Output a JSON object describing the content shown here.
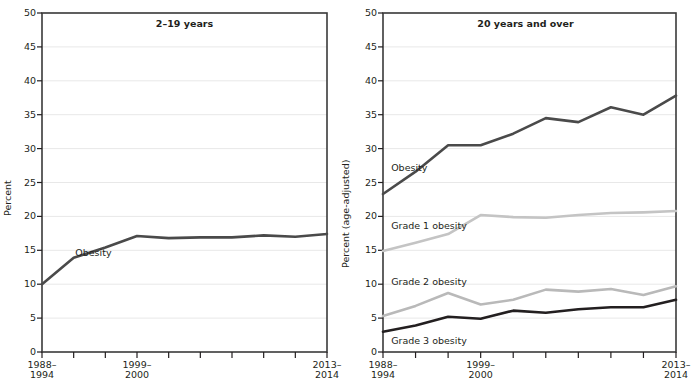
{
  "figure": {
    "background": "#ffffff",
    "grid_color": "#e8e8e8",
    "frame_color": "#3a3a3a"
  },
  "chart_data": [
    {
      "type": "line",
      "title": "2–19 years",
      "xlabel": "",
      "ylabel": "Percent",
      "ylim": [
        0,
        50
      ],
      "ytick_labels": [
        "0",
        "5",
        "10",
        "15",
        "20",
        "25",
        "30",
        "35",
        "40",
        "45",
        "50"
      ],
      "ytick_values": [
        0,
        5,
        10,
        15,
        20,
        25,
        30,
        35,
        40,
        45,
        50
      ],
      "grid": true,
      "legend": "inline-labels",
      "x": [
        1,
        2,
        3,
        4,
        5,
        6,
        7,
        8,
        9,
        10
      ],
      "xtick_labels": [
        "1988–\n1994",
        "",
        "",
        "1999–\n2000",
        "",
        "",
        "",
        "",
        "",
        "2013–\n2014"
      ],
      "xtick_label_lines": [
        [
          "1988–",
          "1994"
        ],
        [
          "1999–",
          "2000"
        ],
        [
          "2013–",
          "2014"
        ]
      ],
      "xtick_label_index": [
        0,
        3,
        9
      ],
      "series": [
        {
          "name": "Obesity",
          "color": "#4a4a4a",
          "width": 2.6,
          "label_x": 2.05,
          "label_y": 14.6,
          "values": [
            10.0,
            13.9,
            15.4,
            17.1,
            16.8,
            16.9,
            16.9,
            17.2,
            17.0,
            17.4
          ]
        }
      ]
    },
    {
      "type": "line",
      "title": "20 years and over",
      "xlabel": "",
      "ylabel": "Percent (age-adjusted)",
      "ylim": [
        0,
        50
      ],
      "ytick_labels": [
        "0",
        "5",
        "10",
        "15",
        "20",
        "25",
        "30",
        "35",
        "40",
        "45",
        "50"
      ],
      "ytick_values": [
        0,
        5,
        10,
        15,
        20,
        25,
        30,
        35,
        40,
        45,
        50
      ],
      "grid": true,
      "legend": "inline-labels",
      "x": [
        1,
        2,
        3,
        4,
        5,
        6,
        7,
        8,
        9,
        10
      ],
      "xtick_labels": [
        "1988–\n1994",
        "",
        "",
        "1999–\n2000",
        "",
        "",
        "",
        "",
        "",
        "2013–\n2014"
      ],
      "xtick_label_lines": [
        [
          "1988–",
          "1994"
        ],
        [
          "1999–",
          "2000"
        ],
        [
          "2013–",
          "2014"
        ]
      ],
      "xtick_label_index": [
        0,
        3,
        9
      ],
      "series": [
        {
          "name": "Obesity",
          "color": "#4a4a4a",
          "width": 2.6,
          "label_x": 1.25,
          "label_y": 27.2,
          "values": [
            23.3,
            26.6,
            30.5,
            30.5,
            32.2,
            34.5,
            33.9,
            36.1,
            35.0,
            37.8
          ]
        },
        {
          "name": "Grade 1 obesity",
          "color": "#c4c4c4",
          "width": 2.6,
          "label_x": 1.25,
          "label_y": 18.6,
          "values": [
            14.9,
            16.1,
            17.4,
            20.2,
            19.9,
            19.8,
            20.2,
            20.5,
            20.6,
            20.8
          ]
        },
        {
          "name": "Grade 2 obesity",
          "color": "#b9b9b9",
          "width": 2.6,
          "label_x": 1.25,
          "label_y": 10.3,
          "values": [
            5.3,
            6.8,
            8.7,
            7.0,
            7.7,
            9.2,
            8.9,
            9.3,
            8.4,
            9.7
          ]
        },
        {
          "name": "Grade 3 obesity",
          "color": "#231f20",
          "width": 2.6,
          "label_x": 1.25,
          "label_y": 1.6,
          "values": [
            3.0,
            3.9,
            5.2,
            4.9,
            6.1,
            5.8,
            6.3,
            6.6,
            6.6,
            7.7
          ]
        }
      ]
    }
  ]
}
